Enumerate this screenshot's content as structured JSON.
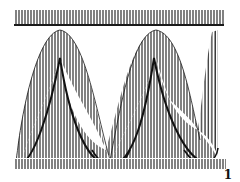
{
  "figure": {
    "label": "1",
    "ink_color": "#1a1a1a",
    "background": "#ffffff",
    "elements": {
      "top_band": "hatched horizontal band with rule beneath",
      "waveform": "two-period hatched sinusoidal envelope with inner cusped curve",
      "bottom_band": "hatched horizontal strip"
    }
  }
}
